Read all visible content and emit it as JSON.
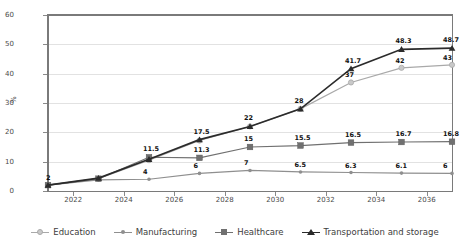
{
  "chart_data": {
    "type": "line",
    "title": "",
    "xlabel": "",
    "ylabel": "%",
    "ylim": [
      0,
      60
    ],
    "ytick_values": [
      0,
      10,
      20,
      30,
      40,
      50,
      60
    ],
    "xlim": [
      2021,
      2037
    ],
    "xtick_labels": [
      "2022",
      "2024",
      "2026",
      "2028",
      "2030",
      "2032",
      "2034",
      "2036"
    ],
    "xtick_values": [
      2022,
      2024,
      2026,
      2028,
      2030,
      2032,
      2034,
      2036
    ],
    "x": [
      2021,
      2023,
      2025,
      2027,
      2029,
      2031,
      2033,
      2035,
      2037
    ],
    "grid": "horizontal",
    "legend_position": "bottom",
    "series": [
      {
        "name": "Education",
        "color": "#a9a9a9",
        "marker": "circle",
        "values": [
          2,
          4.2,
          10.5,
          17.2,
          22,
          28,
          37,
          42,
          43
        ],
        "labels": [
          "",
          "",
          "",
          "",
          "",
          "",
          "37",
          "42",
          "43"
        ]
      },
      {
        "name": "Manufacturing",
        "color": "#8f8f8f",
        "marker": "circle-small",
        "values": [
          2,
          3.8,
          4,
          6,
          7,
          6.5,
          6.3,
          6.1,
          6
        ],
        "labels": [
          "",
          "",
          "4",
          "6",
          "7",
          "6.5",
          "6.3",
          "6.1",
          "6"
        ]
      },
      {
        "name": "Healthcare",
        "color": "#707070",
        "marker": "square",
        "values": [
          2,
          4.2,
          11.5,
          11.3,
          15,
          15.5,
          16.5,
          16.7,
          16.8
        ],
        "labels": [
          "",
          "",
          "11.5",
          "11.3",
          "15",
          "15.5",
          "16.5",
          "16.7",
          "16.8"
        ]
      },
      {
        "name": "Transportation and storage",
        "color": "#2b2b2b",
        "marker": "triangle",
        "values": [
          2,
          4.4,
          10.8,
          17.5,
          22,
          28,
          41.7,
          48.3,
          48.7
        ],
        "labels": [
          "2",
          "",
          "",
          "17.5",
          "22",
          "28",
          "41.7",
          "48.3",
          "48.7"
        ]
      }
    ]
  }
}
